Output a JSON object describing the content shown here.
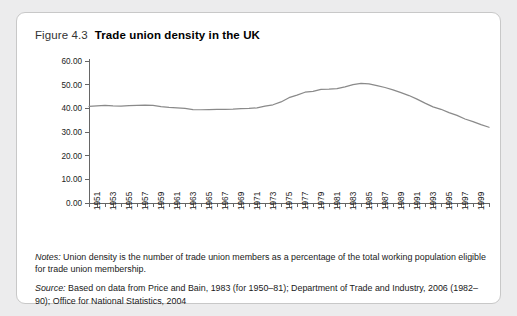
{
  "figure": {
    "number": "Figure 4.3",
    "title": "Trade union density in the UK"
  },
  "notes": {
    "notes_label": "Notes:",
    "notes_text": " Union density is the number of trade union members as a percentage of the total working population eligible for trade union membership.",
    "source_label": "Source:",
    "source_text": " Based on data from Price and Bain, 1983 (for 1950–81); Department of Trade and Industry, 2006 (1982–90); Office for National Statistics, 2004"
  },
  "chart_data": {
    "type": "line",
    "title": "Trade union density in the UK",
    "xlabel": "",
    "ylabel": "",
    "ylim": [
      0,
      60
    ],
    "yticks": [
      0,
      10,
      20,
      30,
      40,
      50,
      60
    ],
    "ytick_labels": [
      "0.00",
      "10.00",
      "20.00",
      "30.00",
      "40.00",
      "50.00",
      "60.00"
    ],
    "xlim": [
      1950,
      2000
    ],
    "xtick_labels": [
      "1951",
      "1953",
      "1955",
      "1957",
      "1959",
      "1961",
      "1963",
      "1965",
      "1967",
      "1969",
      "1971",
      "1973",
      "1975",
      "1977",
      "1979",
      "1981",
      "1983",
      "1985",
      "1987",
      "1989",
      "1991",
      "1993",
      "1995",
      "1997",
      "1999"
    ],
    "grid": false,
    "legend": false,
    "series": [
      {
        "name": "Union density",
        "x": [
          1950,
          1951,
          1952,
          1953,
          1954,
          1955,
          1956,
          1957,
          1958,
          1959,
          1960,
          1961,
          1962,
          1963,
          1964,
          1965,
          1966,
          1967,
          1968,
          1969,
          1970,
          1971,
          1972,
          1973,
          1974,
          1975,
          1976,
          1977,
          1978,
          1979,
          1980,
          1981,
          1982,
          1983,
          1984,
          1985,
          1986,
          1987,
          1988,
          1989,
          1990,
          1991,
          1992,
          1993,
          1994,
          1995,
          1996,
          1997,
          1998,
          1999,
          2000
        ],
        "values": [
          40.8,
          41.0,
          41.2,
          41.0,
          40.9,
          41.1,
          41.3,
          41.4,
          41.2,
          40.7,
          40.4,
          40.2,
          40.0,
          39.5,
          39.4,
          39.5,
          39.6,
          39.6,
          39.7,
          39.9,
          40.0,
          40.2,
          40.9,
          41.5,
          42.7,
          44.5,
          45.6,
          46.8,
          47.2,
          48.0,
          48.1,
          48.3,
          49.1,
          50.0,
          50.5,
          50.3,
          49.6,
          48.8,
          47.8,
          46.6,
          45.4,
          43.9,
          42.2,
          40.6,
          39.6,
          38.2,
          37.0,
          35.5,
          34.4,
          33.1,
          32.0
        ],
        "color": "#8a8a8a"
      }
    ]
  }
}
